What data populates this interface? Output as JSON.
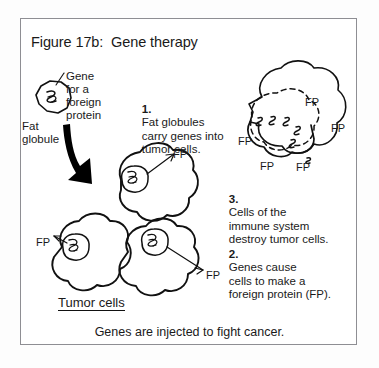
{
  "figure": {
    "title": "Figure 17b:  Gene therapy",
    "caption": "Genes are injected to fight cancer.",
    "border_color": "#8e8e93",
    "ink_color": "#111111",
    "background_color": "#ffffff"
  },
  "labels": {
    "gene_for_foreign_protein": "Gene\nfor a\nforeign\nprotein",
    "fat_globule": "Fat\nglobule",
    "tumor_cells": "Tumor cells"
  },
  "steps": [
    {
      "number": "1.",
      "text": "Fat globules\ncarry genes into\ntumor cells."
    },
    {
      "number": "2.",
      "text": "Genes cause\ncells to make a\nforeign protein (FP)."
    },
    {
      "number": "3.",
      "text": "Cells of the\nimmune system\ndestroy tumor cells."
    }
  ],
  "fp_markers": [
    {
      "id": "fp-tumor-top",
      "text": "FP",
      "x": 173,
      "y": 148
    },
    {
      "id": "fp-tumor-left",
      "text": "FP",
      "x": 36,
      "y": 236
    },
    {
      "id": "fp-tumor-right",
      "text": "FP",
      "x": 206,
      "y": 269
    },
    {
      "id": "fp-immune-top",
      "text": "FP",
      "x": 305,
      "y": 96
    },
    {
      "id": "fp-immune-right",
      "text": "FP",
      "x": 331,
      "y": 122
    },
    {
      "id": "fp-immune-left",
      "text": "FP",
      "x": 238,
      "y": 135
    },
    {
      "id": "fp-immune-bl",
      "text": "FP",
      "x": 260,
      "y": 160
    },
    {
      "id": "fp-immune-br",
      "text": "FP",
      "x": 296,
      "y": 161
    }
  ]
}
